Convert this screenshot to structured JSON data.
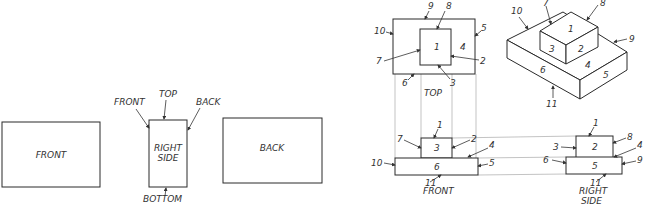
{
  "left_figure": {
    "views": {
      "front": "FRONT",
      "right_side_line1": "RIGHT",
      "right_side_line2": "SIDE",
      "back": "BACK"
    },
    "arrows": {
      "front": "FRONT",
      "top": "TOP",
      "back": "BACK",
      "bottom": "BOTTOM"
    }
  },
  "right_figure": {
    "top_view": {
      "label": "TOP",
      "numbers": {
        "inner": "1",
        "outer": "4",
        "n9": "9",
        "n8": "8",
        "n10": "10",
        "n5": "5",
        "n7": "7",
        "n2": "2",
        "n6": "6",
        "n3": "3"
      }
    },
    "isometric": {
      "numbers": {
        "top_small": "1",
        "left_small": "3",
        "right_small": "2",
        "top_large": "4",
        "left_large": "6",
        "right_large": "5",
        "n10": "10",
        "n7": "7",
        "n8": "8",
        "n9": "9",
        "n11": "11"
      }
    },
    "front_view": {
      "label": "FRONT",
      "numbers": {
        "small": "3",
        "large": "6",
        "n1": "1",
        "n7": "7",
        "n2": "2",
        "n4": "4",
        "n10": "10",
        "n5": "5",
        "n11": "11"
      }
    },
    "right_side_view": {
      "label_line1": "RIGHT",
      "label_line2": "SIDE",
      "numbers": {
        "small": "2",
        "large": "5",
        "n1": "1",
        "n3": "3",
        "n8": "8",
        "n4": "4",
        "n6": "6",
        "n9": "9",
        "n11": "11"
      }
    }
  }
}
